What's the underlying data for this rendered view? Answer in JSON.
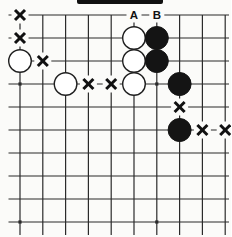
{
  "diagram": {
    "type": "go-board-corner-diagram",
    "colors": {
      "background": "#fbfbf9",
      "line": "#2b2b2b",
      "black_stone": "#141414",
      "white_stone": "#ffffff",
      "stone_outline": "#1f1f1f",
      "mark": "#111111",
      "label": "#111111",
      "top_bar": "#101010"
    },
    "board": {
      "visible_cols": 10,
      "visible_rows": 10,
      "star_points": [
        [
          1,
          4
        ],
        [
          7,
          4
        ],
        [
          1,
          10
        ],
        [
          7,
          10
        ]
      ],
      "white_stones": [
        [
          1,
          3
        ],
        [
          3,
          4
        ],
        [
          6,
          2
        ],
        [
          6,
          3
        ],
        [
          6,
          4
        ]
      ],
      "black_stones": [
        [
          7,
          2
        ],
        [
          7,
          3
        ],
        [
          8,
          4
        ],
        [
          8,
          6
        ]
      ],
      "x_marks": [
        [
          1,
          1
        ],
        [
          1,
          2
        ],
        [
          2,
          3
        ],
        [
          4,
          4
        ],
        [
          5,
          4
        ],
        [
          8,
          5
        ],
        [
          9,
          6
        ],
        [
          10,
          6
        ]
      ],
      "letter_labels": [
        {
          "text": "A",
          "col": 6,
          "row": 1
        },
        {
          "text": "B",
          "col": 7,
          "row": 1
        }
      ]
    }
  }
}
